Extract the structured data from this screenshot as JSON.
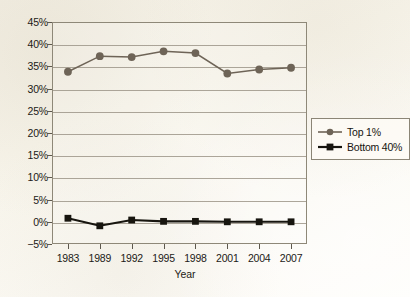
{
  "chart_data": {
    "type": "line",
    "title": "",
    "xlabel": "Year",
    "ylabel": "",
    "categories": [
      "1983",
      "1989",
      "1992",
      "1995",
      "1998",
      "2001",
      "2004",
      "2007"
    ],
    "ylim": [
      -5,
      45
    ],
    "yticks": [
      -5,
      0,
      5,
      10,
      15,
      20,
      25,
      30,
      35,
      40,
      45
    ],
    "ytick_labels": [
      "−5%",
      "0%",
      "5%",
      "10%",
      "15%",
      "20%",
      "25%",
      "30%",
      "35%",
      "40%",
      "45%"
    ],
    "grid": true,
    "legend_position": "right-outside",
    "series": [
      {
        "name": "Top 1%",
        "marker": "circle",
        "color": "#6e6457",
        "values": [
          33.8,
          37.3,
          37.1,
          38.4,
          38.0,
          33.4,
          34.3,
          34.7
        ]
      },
      {
        "name": "Bottom 40%",
        "marker": "square",
        "color": "#17150f",
        "values": [
          0.8,
          -0.9,
          0.4,
          0.1,
          0.1,
          0.0,
          0.0,
          0.0
        ]
      }
    ]
  },
  "legend": {
    "items": [
      {
        "label": "Top 1%"
      },
      {
        "label": "Bottom 40%"
      }
    ]
  },
  "axes": {
    "x_title": "Year"
  }
}
